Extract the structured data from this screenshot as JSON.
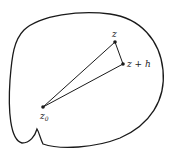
{
  "diagram": {
    "type": "region-with-triangle",
    "points": {
      "z0": {
        "label": "z",
        "subscript": "0",
        "x": 43,
        "y": 107
      },
      "z": {
        "label": "z",
        "x": 115,
        "y": 42
      },
      "zh": {
        "label": "z + h",
        "x": 123,
        "y": 64
      }
    },
    "edges": [
      [
        "z0",
        "z"
      ],
      [
        "z",
        "zh"
      ],
      [
        "zh",
        "z0"
      ]
    ],
    "colors": {
      "stroke": "#1a1a1a",
      "background": "#ffffff"
    }
  }
}
